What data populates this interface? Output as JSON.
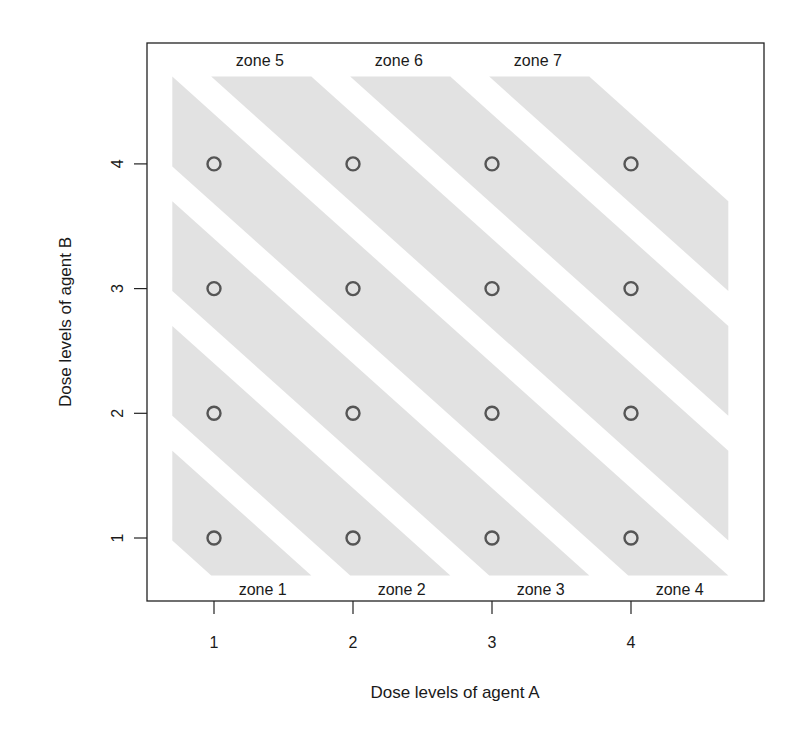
{
  "chart_data": {
    "type": "scatter",
    "title": "",
    "xlabel": "Dose levels of agent A",
    "ylabel": "Dose levels of agent B",
    "xlim": [
      0.5,
      4.95
    ],
    "ylim": [
      0.5,
      4.95
    ],
    "x_ticks": [
      1,
      2,
      3,
      4
    ],
    "y_ticks": [
      1,
      2,
      3,
      4
    ],
    "grid": false,
    "legend": null,
    "points": [
      {
        "x": 1,
        "y": 1
      },
      {
        "x": 2,
        "y": 1
      },
      {
        "x": 3,
        "y": 1
      },
      {
        "x": 4,
        "y": 1
      },
      {
        "x": 1,
        "y": 2
      },
      {
        "x": 2,
        "y": 2
      },
      {
        "x": 3,
        "y": 2
      },
      {
        "x": 4,
        "y": 2
      },
      {
        "x": 1,
        "y": 3
      },
      {
        "x": 2,
        "y": 3
      },
      {
        "x": 3,
        "y": 3
      },
      {
        "x": 4,
        "y": 3
      },
      {
        "x": 1,
        "y": 4
      },
      {
        "x": 2,
        "y": 4
      },
      {
        "x": 3,
        "y": 4
      },
      {
        "x": 4,
        "y": 4
      }
    ],
    "zones": [
      {
        "label": "zone 1",
        "dose_sum": 2,
        "label_x": 1.35,
        "label_y": 0.59
      },
      {
        "label": "zone 2",
        "dose_sum": 3,
        "label_x": 2.35,
        "label_y": 0.59
      },
      {
        "label": "zone 3",
        "dose_sum": 4,
        "label_x": 3.35,
        "label_y": 0.59
      },
      {
        "label": "zone 4",
        "dose_sum": 5,
        "label_x": 4.35,
        "label_y": 0.59
      },
      {
        "label": "zone 5",
        "dose_sum": 6,
        "label_x": 1.33,
        "label_y": 4.83
      },
      {
        "label": "zone 6",
        "dose_sum": 7,
        "label_x": 2.33,
        "label_y": 4.83
      },
      {
        "label": "zone 7",
        "dose_sum": 8,
        "label_x": 3.33,
        "label_y": 4.83
      }
    ],
    "band": {
      "half_width_low": 0.32,
      "half_width_high": 0.4,
      "clip_min": 0.7,
      "clip_max": 4.7
    },
    "colors": {
      "band_fill": "#e2e2e2",
      "point_stroke": "#555555",
      "frame": "#222222"
    }
  }
}
